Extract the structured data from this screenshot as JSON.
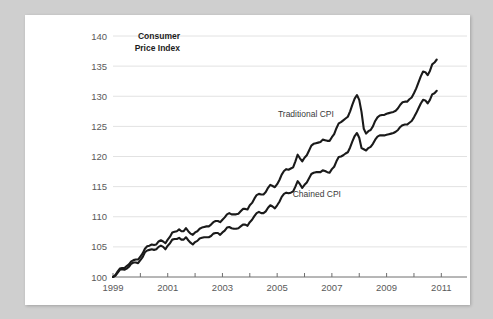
{
  "chart_data": {
    "type": "line",
    "title": "",
    "ylabel": "Consumer Price Index",
    "ylabel_lines": [
      "Consumer",
      "Price Index"
    ],
    "xlabel": "",
    "ylim": [
      100,
      140
    ],
    "yticks": [
      100,
      105,
      110,
      115,
      120,
      125,
      130,
      135,
      140
    ],
    "ytick_labels": [
      "100",
      "105",
      "110",
      "115",
      "120",
      "125",
      "130",
      "135",
      "140"
    ],
    "xlim": [
      1999,
      2011.5
    ],
    "xticks": [
      1999,
      2000,
      2001,
      2002,
      2003,
      2004,
      2005,
      2006,
      2007,
      2008,
      2009,
      2010,
      2011
    ],
    "xtick_labels": [
      "1999",
      "",
      "2001",
      "",
      "2003",
      "",
      "2005",
      "",
      "2007",
      "",
      "2009",
      "",
      "2011"
    ],
    "xtick_labels_shown": [
      "1999",
      "2001",
      "2003",
      "2005",
      "2007",
      "2009",
      "2011"
    ],
    "grid": "horizontal",
    "legend": "inline-annotations",
    "line_color": "#1a1a1a",
    "grid_color": "#e2e2e2",
    "axis_color": "#6e6e6e",
    "background": "#ffffff",
    "page_background": "#cfcfcf",
    "annotations": [
      {
        "name": "traditional-cpi-label",
        "text": "Traditional CPI",
        "x": 2006.05,
        "y": 126.6
      },
      {
        "name": "chained-cpi-label",
        "text": "Chained CPI",
        "x": 2006.45,
        "y": 113.3
      }
    ],
    "series": [
      {
        "name": "Traditional CPI",
        "x_start": 1999.0,
        "x_step": 0.08333,
        "values": [
          100.0,
          100.3,
          100.9,
          101.4,
          101.5,
          101.5,
          101.8,
          102.1,
          102.6,
          102.8,
          102.9,
          102.9,
          103.4,
          103.9,
          104.7,
          105.1,
          105.2,
          105.4,
          105.3,
          105.4,
          105.9,
          106.1,
          105.9,
          105.6,
          106.2,
          106.7,
          107.4,
          107.5,
          107.6,
          107.9,
          107.6,
          107.6,
          108.1,
          107.6,
          107.2,
          107.0,
          107.4,
          107.6,
          108.0,
          108.2,
          108.3,
          108.4,
          108.4,
          108.7,
          109.1,
          109.3,
          109.3,
          109.1,
          109.5,
          109.9,
          110.4,
          110.6,
          110.4,
          110.4,
          110.4,
          110.5,
          110.9,
          111.3,
          111.3,
          111.2,
          111.9,
          112.3,
          113.0,
          113.6,
          113.8,
          113.7,
          113.7,
          114.1,
          114.8,
          115.3,
          115.1,
          114.9,
          115.4,
          116.1,
          117.0,
          117.6,
          117.9,
          117.8,
          118.0,
          118.2,
          119.2,
          120.3,
          119.7,
          119.2,
          119.8,
          120.2,
          121.0,
          121.8,
          122.1,
          122.2,
          122.3,
          122.4,
          122.8,
          122.7,
          122.6,
          122.6,
          123.2,
          123.7,
          124.7,
          125.5,
          125.7,
          126.0,
          126.3,
          126.6,
          127.5,
          128.6,
          129.6,
          130.2,
          129.4,
          127.4,
          124.6,
          123.8,
          124.2,
          124.4,
          125.0,
          125.9,
          126.5,
          126.8,
          126.9,
          126.9,
          127.1,
          127.2,
          127.3,
          127.4,
          127.6,
          128.0,
          128.6,
          129.0,
          129.1,
          129.1,
          129.5,
          129.8,
          130.5,
          131.3,
          132.3,
          133.3,
          134.1,
          134.0,
          133.5,
          134.2,
          135.3,
          135.6,
          136.1
        ]
      },
      {
        "name": "Chained CPI",
        "x_start": 1999.0,
        "x_step": 0.08333,
        "values": [
          100.0,
          100.2,
          100.7,
          101.2,
          101.3,
          101.2,
          101.4,
          101.7,
          102.2,
          102.4,
          102.4,
          102.3,
          102.8,
          103.3,
          104.1,
          104.4,
          104.5,
          104.6,
          104.5,
          104.6,
          105.0,
          105.2,
          105.0,
          104.6,
          105.2,
          105.6,
          106.2,
          106.3,
          106.3,
          106.5,
          106.2,
          106.2,
          106.6,
          106.1,
          105.7,
          105.4,
          105.8,
          106.0,
          106.4,
          106.5,
          106.6,
          106.6,
          106.6,
          106.8,
          107.2,
          107.3,
          107.3,
          107.0,
          107.4,
          107.7,
          108.2,
          108.3,
          108.1,
          108.0,
          108.0,
          108.1,
          108.4,
          108.7,
          108.7,
          108.5,
          109.1,
          109.5,
          110.1,
          110.6,
          110.8,
          110.6,
          110.6,
          110.9,
          111.5,
          111.9,
          111.7,
          111.4,
          111.9,
          112.5,
          113.3,
          113.8,
          114.0,
          113.9,
          114.0,
          114.2,
          115.0,
          115.9,
          115.4,
          114.8,
          115.3,
          115.7,
          116.4,
          117.1,
          117.3,
          117.4,
          117.4,
          117.4,
          117.7,
          117.6,
          117.4,
          117.3,
          117.9,
          118.3,
          119.2,
          119.9,
          120.0,
          120.2,
          120.5,
          120.7,
          121.5,
          122.5,
          123.4,
          123.9,
          123.1,
          121.4,
          121.2,
          121.0,
          121.4,
          121.6,
          122.1,
          122.8,
          123.3,
          123.5,
          123.5,
          123.5,
          123.6,
          123.7,
          123.8,
          123.9,
          124.1,
          124.4,
          124.9,
          125.2,
          125.3,
          125.3,
          125.6,
          125.9,
          126.5,
          127.2,
          128.0,
          128.8,
          129.4,
          129.3,
          128.8,
          129.4,
          130.3,
          130.5,
          130.9
        ]
      }
    ]
  }
}
